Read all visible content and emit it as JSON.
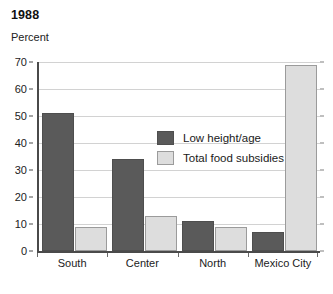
{
  "chart_data": {
    "type": "bar",
    "title": "1988",
    "subtitle": "",
    "xlabel": "",
    "ylabel": "Percent",
    "categories": [
      "South",
      "Center",
      "North",
      "Mexico City"
    ],
    "series": [
      {
        "name": "Low height/age",
        "color": "#5a5a5a",
        "values": [
          51,
          34,
          11,
          7
        ]
      },
      {
        "name": "Total food subsidies",
        "color": "#dddddd",
        "values": [
          9,
          13,
          9,
          69
        ]
      }
    ],
    "ylim": [
      0,
      70
    ],
    "yticks": [
      0,
      10,
      20,
      30,
      40,
      50,
      60,
      70
    ],
    "ytick_labels": [
      "0",
      "10",
      "20",
      "30",
      "40",
      "50",
      "60",
      "70"
    ],
    "grid": true,
    "legend_position": "inside-top-center"
  }
}
